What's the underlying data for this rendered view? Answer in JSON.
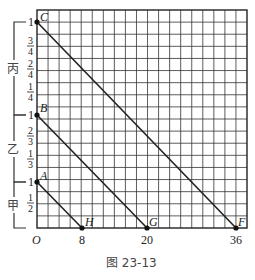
{
  "figure": {
    "caption": "图 23-13",
    "origin_label": "O",
    "x_ticks": [
      {
        "label": "8",
        "value": 8
      },
      {
        "label": "20",
        "value": 20
      },
      {
        "label": "36",
        "value": 36
      }
    ],
    "groups": [
      {
        "name": "丙",
        "top_label": "1",
        "fractions": [
          "3/4",
          "2/4",
          "1/4"
        ]
      },
      {
        "name": "乙",
        "top_label": "1",
        "fractions": [
          "2/3",
          "1/3"
        ]
      },
      {
        "name": "甲",
        "top_label": "1",
        "fractions": [
          "1/2"
        ]
      }
    ],
    "points": [
      {
        "label": "A",
        "desc": "甲 top"
      },
      {
        "label": "B",
        "desc": "乙 top"
      },
      {
        "label": "C",
        "desc": "丙 top"
      },
      {
        "label": "H",
        "x": 8
      },
      {
        "label": "G",
        "x": 20
      },
      {
        "label": "F",
        "x": 36
      }
    ],
    "segments": [
      {
        "from": "A",
        "to": "H"
      },
      {
        "from": "B",
        "to": "G"
      },
      {
        "from": "C",
        "to": "F"
      }
    ]
  }
}
